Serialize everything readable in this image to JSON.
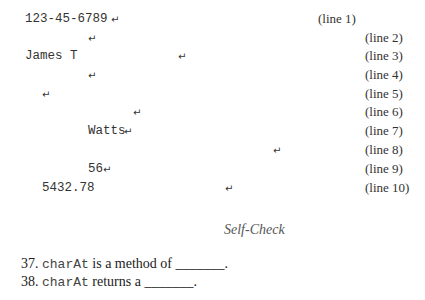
{
  "lines": [
    {
      "text": "123-45-6789",
      "label": "(line 1)"
    },
    {
      "text": "",
      "label": "(line 2)"
    },
    {
      "text": "James T",
      "label": "(line 3)"
    },
    {
      "text": "",
      "label": "(line 4)"
    },
    {
      "text": "",
      "label": "(line 5)"
    },
    {
      "text": "",
      "label": "(line 6)"
    },
    {
      "text": "Watts",
      "label": "(line 7)"
    },
    {
      "text": "",
      "label": "(line 8)"
    },
    {
      "text": "56",
      "label": "(line 9)"
    },
    {
      "text": "5432.78",
      "label": "(line 10)"
    }
  ],
  "return_symbol": "↵",
  "heading": "Self-Check",
  "questions": [
    {
      "number": "37.",
      "code": "charAt",
      "text": " is a method of ",
      "blank": "_______",
      "end": "."
    },
    {
      "number": "38.",
      "code": "charAt",
      "text": " returns a ",
      "blank": "_______",
      "end": "."
    }
  ]
}
